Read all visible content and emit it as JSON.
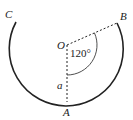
{
  "diagram": {
    "points": {
      "center": "O",
      "bottom": "A",
      "right_end": "B",
      "left_end": "C"
    },
    "angle_label": "120°",
    "segment_label": "a",
    "colors": {
      "stroke": "#222222",
      "background": "#ffffff"
    }
  }
}
